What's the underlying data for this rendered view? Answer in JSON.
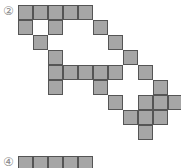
{
  "figure_2": {
    "label": "②",
    "cell_size": 15,
    "fill_color": "#a6a6a6",
    "border_color": "#555555",
    "cells": [
      [
        0,
        0
      ],
      [
        0,
        1
      ],
      [
        0,
        2
      ],
      [
        0,
        3
      ],
      [
        0,
        4
      ],
      [
        1,
        0
      ],
      [
        1,
        2
      ],
      [
        1,
        5
      ],
      [
        2,
        1
      ],
      [
        2,
        6
      ],
      [
        3,
        2
      ],
      [
        3,
        7
      ],
      [
        4,
        2
      ],
      [
        4,
        3
      ],
      [
        4,
        4
      ],
      [
        4,
        5
      ],
      [
        4,
        6
      ],
      [
        4,
        8
      ],
      [
        5,
        2
      ],
      [
        5,
        5
      ],
      [
        5,
        9
      ],
      [
        6,
        6
      ],
      [
        6,
        8
      ],
      [
        6,
        9
      ],
      [
        6,
        10
      ],
      [
        7,
        7
      ],
      [
        7,
        8
      ],
      [
        7,
        9
      ],
      [
        8,
        8
      ]
    ]
  },
  "figure_4": {
    "label": "④",
    "cells": [
      [
        0,
        0
      ],
      [
        0,
        1
      ],
      [
        0,
        2
      ],
      [
        0,
        3
      ],
      [
        0,
        4
      ]
    ]
  }
}
